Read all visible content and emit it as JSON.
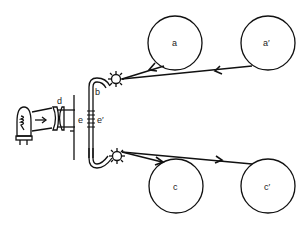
{
  "diagram": {
    "type": "optical projection / film path schematic",
    "labels": {
      "a": "a",
      "a_prime": "a′",
      "b": "b",
      "c": "c",
      "c_prime": "c′",
      "d": "d",
      "e": "e",
      "e_prime": "e′"
    },
    "components": [
      {
        "id": "lamp",
        "description": "projection lamp bulb"
      },
      {
        "id": "d",
        "description": "condenser lens pair"
      },
      {
        "id": "e",
        "description": "aperture plate"
      },
      {
        "id": "e_prime",
        "description": "gate / film frame"
      },
      {
        "id": "b",
        "description": "film loop (U-shaped path)"
      },
      {
        "id": "a",
        "description": "upper reel"
      },
      {
        "id": "a_prime",
        "description": "upper reel (far)"
      },
      {
        "id": "c",
        "description": "lower reel"
      },
      {
        "id": "c_prime",
        "description": "lower reel (far)"
      }
    ],
    "colors": {
      "line": "#111111",
      "background": "#ffffff"
    }
  }
}
